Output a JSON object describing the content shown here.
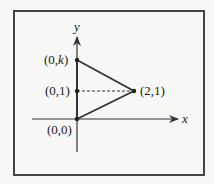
{
  "diagram": {
    "type": "coordinate-triangle",
    "axes": {
      "x_label": "x",
      "y_label": "y"
    },
    "points": [
      {
        "id": "origin",
        "label_pre": "(0,0)",
        "coords": [
          0,
          0
        ]
      },
      {
        "id": "unit",
        "label_pre": "(0,1)",
        "coords": [
          0,
          1
        ]
      },
      {
        "id": "top",
        "label_pre": "(0,",
        "label_var": "k",
        "label_post": ")",
        "coords": [
          0,
          "k"
        ]
      },
      {
        "id": "right",
        "label_pre": "(2,1)",
        "coords": [
          2,
          1
        ]
      }
    ],
    "edges": [
      {
        "from": "origin",
        "to": "top",
        "style": "solid"
      },
      {
        "from": "top",
        "to": "right",
        "style": "solid"
      },
      {
        "from": "right",
        "to": "origin",
        "style": "solid"
      },
      {
        "from": "unit",
        "to": "right",
        "style": "dashed"
      }
    ],
    "colors": {
      "stroke": "#333333",
      "background": "#f7f7f5",
      "frame": "#444444"
    }
  }
}
